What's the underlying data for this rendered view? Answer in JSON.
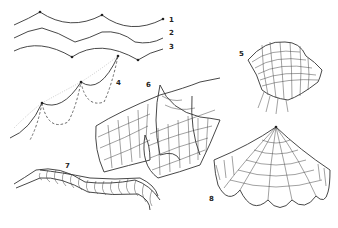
{
  "figure": {
    "labels": [
      {
        "id": "1",
        "text": "1",
        "x": 169,
        "y": 20
      },
      {
        "id": "2",
        "text": "2",
        "x": 169,
        "y": 33
      },
      {
        "id": "3",
        "text": "3",
        "x": 169,
        "y": 47
      },
      {
        "id": "4",
        "text": "4",
        "x": 116,
        "y": 82
      },
      {
        "id": "5",
        "text": "5",
        "x": 239,
        "y": 53
      },
      {
        "id": "6",
        "text": "6",
        "x": 146,
        "y": 83
      },
      {
        "id": "7",
        "text": "7",
        "x": 65,
        "y": 163
      },
      {
        "id": "8",
        "text": "8",
        "x": 209,
        "y": 197
      }
    ],
    "descriptions": {
      "1": "catenary curve hanging between three support points",
      "2": "smooth undulating curve",
      "3": "inverted curve with lower support points",
      "4": "stepped cable chains with solid, dashed and dotted sag curves",
      "5": "saddle-shaped cable-net surface",
      "6": "double trough cable-net membrane",
      "7": "wavy strip surface with transverse ribs",
      "8": "tent-like membrane hung from a single peak with scalloped edges"
    }
  }
}
